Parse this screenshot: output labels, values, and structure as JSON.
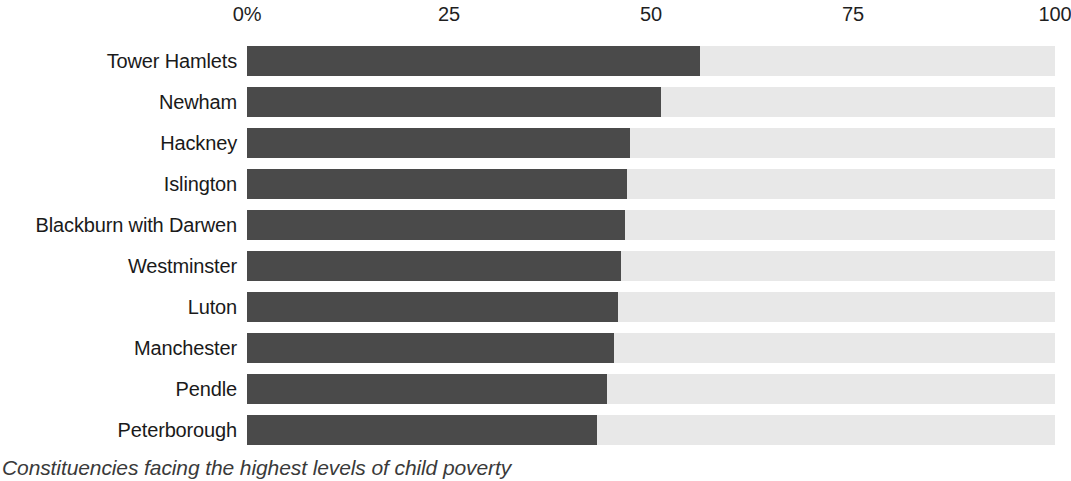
{
  "chart_data": {
    "type": "bar",
    "orientation": "horizontal",
    "title": "",
    "caption": "Constituencies facing the highest levels of child poverty",
    "xlabel": "",
    "ylabel": "",
    "xlim": [
      0,
      100
    ],
    "grid": false,
    "legend": null,
    "axis_ticks": [
      {
        "label": "0%",
        "value": 0
      },
      {
        "label": "25",
        "value": 25
      },
      {
        "label": "50",
        "value": 50
      },
      {
        "label": "75",
        "value": 75
      },
      {
        "label": "100",
        "value": 100
      }
    ],
    "categories": [
      "Tower Hamlets",
      "Newham",
      "Hackney",
      "Islington",
      "Blackburn with Darwen",
      "Westminster",
      "Luton",
      "Manchester",
      "Pendle",
      "Peterborough"
    ],
    "values": [
      56.1,
      51.2,
      47.4,
      47.0,
      46.8,
      46.3,
      45.9,
      45.4,
      44.6,
      43.3
    ],
    "colors": {
      "bar": "#4a4a4a",
      "track": "#e8e8e8",
      "text": "#1a1a1a",
      "caption": "#3a3a3a",
      "background": "#ffffff"
    }
  }
}
